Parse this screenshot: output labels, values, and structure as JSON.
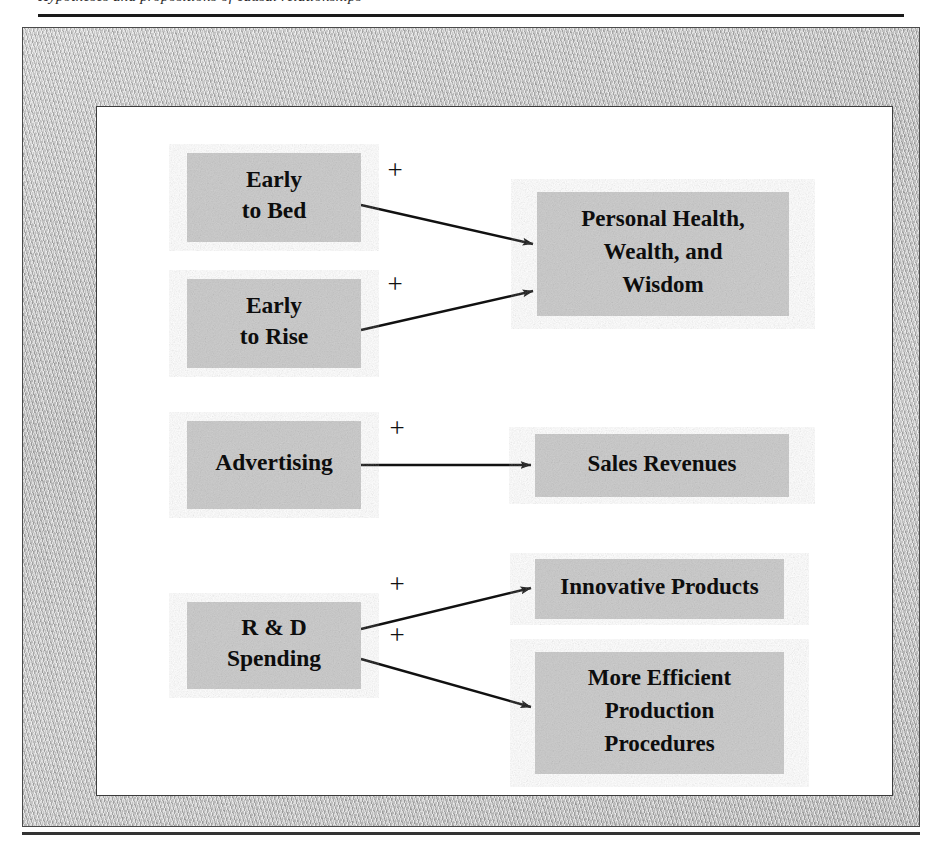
{
  "page": {
    "running_head_fragment": "Hypotheses and propositions of causal relationships",
    "figure_title": "Causal Relationship Diagram"
  },
  "diagram": {
    "type": "causal-relationship",
    "sign_symbol": "+",
    "box_fill_color": "#c8c8c8",
    "canvas_color": "#ffffff",
    "frame_color": "#b9b9b9",
    "line_color": "#111111",
    "nodes": [
      {
        "id": "early-to-bed",
        "lines": [
          "Early",
          "to Bed"
        ],
        "x": 90,
        "y": 46,
        "w": 174,
        "h": 89,
        "text_size": "size-lg"
      },
      {
        "id": "early-to-rise",
        "lines": [
          "Early",
          "to Rise"
        ],
        "x": 90,
        "y": 172,
        "w": 174,
        "h": 89,
        "text_size": "size-lg"
      },
      {
        "id": "personal-health-wealth-wisdom",
        "lines": [
          "Personal Health,",
          "Wealth, and",
          "Wisdom"
        ],
        "x": 440,
        "y": 85,
        "w": 252,
        "h": 124,
        "text_size": "size-md"
      },
      {
        "id": "advertising",
        "lines": [
          "Advertising"
        ],
        "x": 90,
        "y": 314,
        "w": 174,
        "h": 88,
        "text_size": "size-lg"
      },
      {
        "id": "sales-revenues",
        "lines": [
          "Sales Revenues"
        ],
        "x": 438,
        "y": 327,
        "w": 254,
        "h": 63,
        "text_size": "size-md"
      },
      {
        "id": "rd-spending",
        "lines": [
          "R & D",
          "Spending"
        ],
        "x": 90,
        "y": 495,
        "w": 174,
        "h": 87,
        "text_size": "size-lg"
      },
      {
        "id": "innovative-products",
        "lines": [
          "Innovative Products"
        ],
        "x": 438,
        "y": 452,
        "w": 249,
        "h": 60,
        "text_size": "size-md"
      },
      {
        "id": "more-efficient-production-procedures",
        "lines": [
          "More Efficient",
          "Production",
          "Procedures"
        ],
        "x": 438,
        "y": 545,
        "w": 249,
        "h": 122,
        "text_size": "size-md"
      }
    ],
    "links": [
      {
        "id": "bed-to-health",
        "from": "early-to-bed",
        "to": "personal-health-wealth-wisdom",
        "sign": "+",
        "x1": 264,
        "y1": 98,
        "x2": 436,
        "y2": 137,
        "sign_x": 298,
        "sign_y": 66
      },
      {
        "id": "rise-to-health",
        "from": "early-to-rise",
        "to": "personal-health-wealth-wisdom",
        "sign": "+",
        "x1": 264,
        "y1": 223,
        "x2": 436,
        "y2": 184,
        "sign_x": 298,
        "sign_y": 180
      },
      {
        "id": "advertising-to-sales",
        "from": "advertising",
        "to": "sales-revenues",
        "sign": "+",
        "x1": 264,
        "y1": 358,
        "x2": 434,
        "y2": 358,
        "sign_x": 300,
        "sign_y": 324
      },
      {
        "id": "rd-to-innovative",
        "from": "rd-spending",
        "to": "innovative-products",
        "sign": "+",
        "x1": 264,
        "y1": 522,
        "x2": 434,
        "y2": 481,
        "sign_x": 300,
        "sign_y": 480
      },
      {
        "id": "rd-to-production",
        "from": "rd-spending",
        "to": "more-efficient-production-procedures",
        "sign": "+",
        "x1": 264,
        "y1": 552,
        "x2": 434,
        "y2": 600,
        "sign_x": 300,
        "sign_y": 531
      }
    ]
  }
}
